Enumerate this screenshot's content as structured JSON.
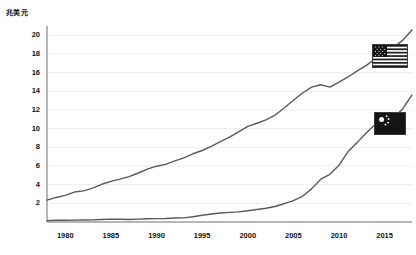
{
  "axis": {
    "y_title": "兆美元",
    "y_ticks": [
      2,
      4,
      6,
      8,
      10,
      12,
      14,
      16,
      18,
      20
    ],
    "x_ticks": [
      1980,
      1985,
      1990,
      1995,
      2000,
      2005,
      2010,
      2015
    ]
  },
  "legend": {
    "us_flag_name": "united-states-flag",
    "cn_flag_name": "china-flag"
  },
  "colors": {
    "line": "#595959",
    "axis": "#6f6f6f",
    "grid": "#ededed",
    "text": "#111111",
    "flag_border": "#3b3b3b"
  },
  "chart_data": {
    "type": "line",
    "title": "",
    "subtitle": "",
    "xlabel": "",
    "ylabel": "兆美元",
    "xlim": [
      1978,
      2018
    ],
    "ylim": [
      0,
      21
    ],
    "grid": true,
    "legend_position": "right-inline-flags",
    "x": [
      1978,
      1979,
      1980,
      1981,
      1982,
      1983,
      1984,
      1985,
      1986,
      1987,
      1988,
      1989,
      1990,
      1991,
      1992,
      1993,
      1994,
      1995,
      1996,
      1997,
      1998,
      1999,
      2000,
      2001,
      2002,
      2003,
      2004,
      2005,
      2006,
      2007,
      2008,
      2009,
      2010,
      2011,
      2012,
      2013,
      2014,
      2015,
      2016,
      2017,
      2018
    ],
    "series": [
      {
        "name": "United States",
        "flag": "united-states-flag",
        "values": [
          2.35,
          2.63,
          2.86,
          3.21,
          3.34,
          3.63,
          4.04,
          4.35,
          4.59,
          4.87,
          5.25,
          5.66,
          5.98,
          6.17,
          6.54,
          6.88,
          7.31,
          7.66,
          8.1,
          8.61,
          9.09,
          9.66,
          10.25,
          10.58,
          10.94,
          11.46,
          12.22,
          13.04,
          13.82,
          14.45,
          14.71,
          14.45,
          14.99,
          15.54,
          16.2,
          16.78,
          17.52,
          18.22,
          18.71,
          19.49,
          20.58
        ]
      },
      {
        "name": "China",
        "flag": "china-flag",
        "values": [
          0.15,
          0.18,
          0.19,
          0.2,
          0.21,
          0.23,
          0.26,
          0.31,
          0.3,
          0.27,
          0.31,
          0.35,
          0.36,
          0.38,
          0.43,
          0.44,
          0.56,
          0.73,
          0.86,
          0.96,
          1.03,
          1.09,
          1.21,
          1.34,
          1.47,
          1.66,
          1.96,
          2.29,
          2.75,
          3.55,
          4.59,
          5.11,
          6.09,
          7.55,
          8.53,
          9.57,
          10.48,
          11.06,
          11.23,
          12.14,
          13.61
        ]
      }
    ]
  }
}
